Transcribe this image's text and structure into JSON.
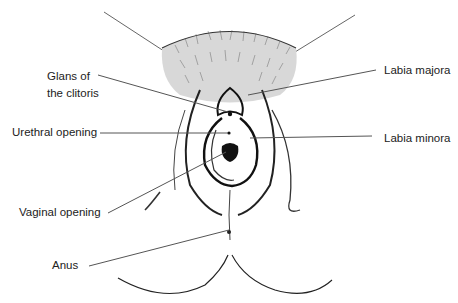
{
  "diagram": {
    "type": "anatomical-line-drawing",
    "colors": {
      "ink": "#1a1a1a",
      "leader": "#555555",
      "background": "#ffffff"
    },
    "labels": [
      {
        "id": "glans",
        "lines": [
          "Glans of",
          "the clitoris"
        ],
        "x": 47,
        "y": 68,
        "side": "left"
      },
      {
        "id": "urethral",
        "text": "Urethral opening",
        "x": 12,
        "y": 124,
        "side": "left"
      },
      {
        "id": "vaginal",
        "text": "Vaginal opening",
        "x": 19,
        "y": 204,
        "side": "left"
      },
      {
        "id": "anus",
        "text": "Anus",
        "x": 52,
        "y": 259,
        "side": "left"
      },
      {
        "id": "majora",
        "text": "Labia majora",
        "x": 384,
        "y": 64,
        "side": "right"
      },
      {
        "id": "minora",
        "text": "Labia minora",
        "x": 384,
        "y": 132,
        "side": "right"
      }
    ]
  }
}
